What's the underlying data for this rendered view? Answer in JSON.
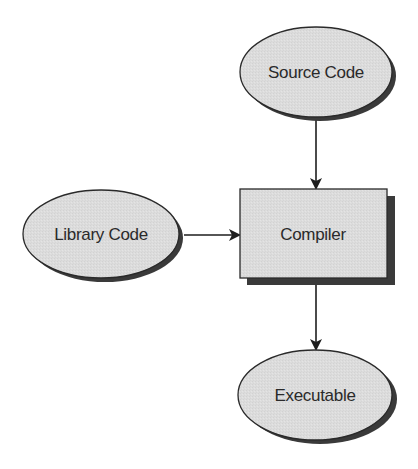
{
  "diagram": {
    "type": "flowchart",
    "colors": {
      "node_fill": "#dcdcdc",
      "node_stroke": "#2a2a2a",
      "shadow": "#3a3a3a",
      "edge": "#1e1e1e",
      "text": "#2a2a2a",
      "background": "#ffffff"
    },
    "nodes": [
      {
        "id": "source",
        "shape": "ellipse",
        "label": "Source Code"
      },
      {
        "id": "library",
        "shape": "ellipse",
        "label": "Library Code"
      },
      {
        "id": "compiler",
        "shape": "rectangle",
        "label": "Compiler"
      },
      {
        "id": "executable",
        "shape": "ellipse",
        "label": "Executable"
      }
    ],
    "edges": [
      {
        "from": "source",
        "to": "compiler"
      },
      {
        "from": "library",
        "to": "compiler"
      },
      {
        "from": "compiler",
        "to": "executable"
      }
    ]
  }
}
